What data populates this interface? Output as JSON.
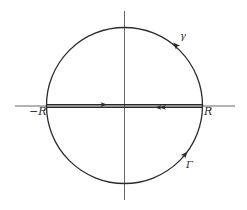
{
  "diagram": {
    "type": "contour-integration",
    "colors": {
      "ink": "#2a2a2a",
      "axis": "#555555",
      "background": "#ffffff"
    },
    "labels": {
      "neg_r": "−R",
      "pos_r": "R",
      "upper_arc": "γ",
      "lower_arc": "Γ"
    },
    "elements": [
      {
        "id": "x-axis",
        "kind": "line",
        "orientation": "horizontal"
      },
      {
        "id": "y-axis",
        "kind": "line",
        "orientation": "vertical"
      },
      {
        "id": "circle",
        "kind": "circle",
        "radius_label": "R"
      },
      {
        "id": "segment-upper",
        "kind": "line",
        "from": "-R",
        "to": "R",
        "arrow": "single, pointing right"
      },
      {
        "id": "segment-lower",
        "kind": "line",
        "from": "R",
        "to": "-R",
        "arrow": "double, pointing left"
      },
      {
        "id": "arc-gamma",
        "kind": "arc",
        "label": "γ",
        "arrow": "counterclockwise on upper semicircle"
      },
      {
        "id": "arc-Gamma",
        "kind": "arc",
        "label": "Γ",
        "arrow": "counterclockwise on lower semicircle"
      }
    ]
  }
}
